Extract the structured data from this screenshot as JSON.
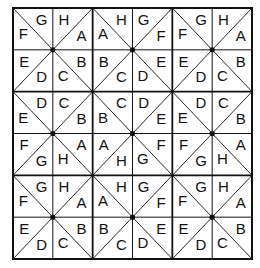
{
  "grid": {
    "rows": 6,
    "cols": 6,
    "origin": [
      13,
      8
    ],
    "size": [
      239,
      251
    ],
    "line_color": "#111111",
    "cells": [
      [
        {
          "d": "\\",
          "a": "F",
          "b": "G"
        },
        {
          "d": "/",
          "a": "H",
          "b": "A"
        },
        {
          "d": "\\",
          "a": "A",
          "b": "H"
        },
        {
          "d": "/",
          "a": "G",
          "b": "F"
        },
        {
          "d": "\\",
          "a": "F",
          "b": "G"
        },
        {
          "d": "/",
          "a": "H",
          "b": "A"
        }
      ],
      [
        {
          "d": "/",
          "a": "E",
          "b": "D"
        },
        {
          "d": "\\",
          "a": "C",
          "b": "B"
        },
        {
          "d": "/",
          "a": "B",
          "b": "C"
        },
        {
          "d": "\\",
          "a": "D",
          "b": "E"
        },
        {
          "d": "/",
          "a": "E",
          "b": "D"
        },
        {
          "d": "\\",
          "a": "C",
          "b": "B"
        }
      ],
      [
        {
          "d": "\\",
          "a": "E",
          "b": "D"
        },
        {
          "d": "/",
          "a": "C",
          "b": "B"
        },
        {
          "d": "\\",
          "a": "B",
          "b": "C"
        },
        {
          "d": "/",
          "a": "D",
          "b": "E"
        },
        {
          "d": "\\",
          "a": "E",
          "b": "D"
        },
        {
          "d": "/",
          "a": "C",
          "b": "B"
        }
      ],
      [
        {
          "d": "/",
          "a": "F",
          "b": "G"
        },
        {
          "d": "\\",
          "a": "H",
          "b": "A"
        },
        {
          "d": "/",
          "a": "A",
          "b": "H"
        },
        {
          "d": "\\",
          "a": "G",
          "b": "F"
        },
        {
          "d": "/",
          "a": "F",
          "b": "G"
        },
        {
          "d": "\\",
          "a": "H",
          "b": "A"
        }
      ],
      [
        {
          "d": "\\",
          "a": "F",
          "b": "G"
        },
        {
          "d": "/",
          "a": "H",
          "b": "A"
        },
        {
          "d": "\\",
          "a": "A",
          "b": "H"
        },
        {
          "d": "/",
          "a": "G",
          "b": "F"
        },
        {
          "d": "\\",
          "a": "F",
          "b": "G"
        },
        {
          "d": "/",
          "a": "H",
          "b": "A"
        }
      ],
      [
        {
          "d": "/",
          "a": "E",
          "b": "D"
        },
        {
          "d": "\\",
          "a": "C",
          "b": "B"
        },
        {
          "d": "/",
          "a": "B",
          "b": "C"
        },
        {
          "d": "\\",
          "a": "D",
          "b": "E"
        },
        {
          "d": "/",
          "a": "E",
          "b": "D"
        },
        {
          "d": "\\",
          "a": "C",
          "b": "B"
        }
      ]
    ],
    "dots": [
      [
        2,
        2
      ],
      [
        2,
        4
      ],
      [
        4,
        2
      ],
      [
        4,
        4
      ],
      [
        1,
        1
      ],
      [
        1,
        3
      ],
      [
        1,
        5
      ],
      [
        3,
        1
      ],
      [
        3,
        3
      ],
      [
        3,
        5
      ],
      [
        5,
        1
      ],
      [
        5,
        3
      ],
      [
        5,
        5
      ]
    ]
  }
}
